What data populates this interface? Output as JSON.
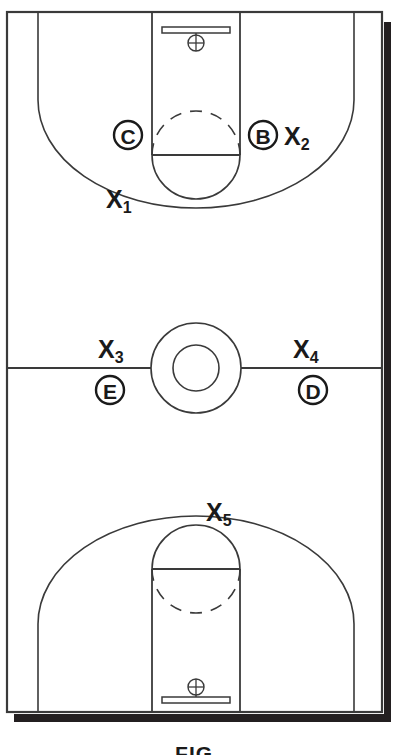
{
  "figure": {
    "caption": "FIG.",
    "court_line_color": "#3a3a3a",
    "shadow_color": "#231f20",
    "background_color": "#ffffff",
    "text_color": "#1a1a1a"
  },
  "markers": {
    "player_circles": [
      {
        "id": "c",
        "letter": "C",
        "cx": 128,
        "cy": 135,
        "r": 14
      },
      {
        "id": "b",
        "letter": "B",
        "cx": 263,
        "cy": 135,
        "r": 14
      },
      {
        "id": "e",
        "letter": "E",
        "cx": 110,
        "cy": 390,
        "r": 14
      },
      {
        "id": "d",
        "letter": "D",
        "cx": 313,
        "cy": 390,
        "r": 14
      }
    ],
    "position_labels": [
      {
        "id": "x1",
        "base": "X",
        "sub": "1",
        "x": 106,
        "y": 208
      },
      {
        "id": "x2",
        "base": "X",
        "sub": "2",
        "x": 284,
        "y": 145
      },
      {
        "id": "x3",
        "base": "X",
        "sub": "3",
        "x": 98,
        "y": 358
      },
      {
        "id": "x4",
        "base": "X",
        "sub": "4",
        "x": 293,
        "y": 358
      },
      {
        "id": "x5",
        "base": "X",
        "sub": "5",
        "x": 206,
        "y": 521
      }
    ]
  },
  "court": {
    "boundary": {
      "left": 7,
      "top": 12,
      "right": 382,
      "bottom": 712
    },
    "halfcourt_line_y": 368,
    "center_circle": {
      "cx": 196,
      "cy": 368,
      "outer_r": 45,
      "inner_r": 23
    },
    "top_key": {
      "left": 152,
      "right": 240,
      "free_throw_y": 155
    },
    "bottom_key": {
      "left": 152,
      "right": 240,
      "free_throw_y": 569
    },
    "hoops": [
      {
        "id": "top-hoop",
        "cx": 196,
        "cy": 42
      },
      {
        "id": "bottom-hoop",
        "cx": 196,
        "cy": 688
      }
    ],
    "backboards": [
      {
        "id": "top-backboard",
        "cx": 196,
        "y": 30,
        "width": 68
      },
      {
        "id": "bottom-backboard",
        "cx": 196,
        "y": 700,
        "width": 68
      }
    ]
  }
}
